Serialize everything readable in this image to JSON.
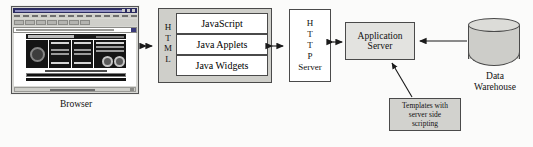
{
  "diagram": {
    "nodes": {
      "browser": {
        "caption": "Browser",
        "icon": "browser-window-icon"
      },
      "html": {
        "label": "HTML",
        "letters": [
          "H",
          "T",
          "M",
          "L"
        ],
        "children": [
          {
            "label": "JavaScript"
          },
          {
            "label": "Java Applets"
          },
          {
            "label": "Java Widgets"
          }
        ]
      },
      "http_server": {
        "label": "HTTP Server",
        "lines": [
          "H",
          "T",
          "T",
          "P",
          "Server"
        ]
      },
      "app_server": {
        "label": "Application Server",
        "line1": "Application",
        "line2": "Server"
      },
      "templates": {
        "label": "Templates with server side scripting",
        "line1": "Templates with",
        "line2": "server side",
        "line3": "scripting"
      },
      "data_warehouse": {
        "caption": "Data Warehouse",
        "line1": "Data",
        "line2": "Warehouse",
        "icon": "database-cylinder-icon"
      }
    },
    "connectors": [
      {
        "name": "browser-to-html",
        "type": "double-arrow"
      },
      {
        "name": "html-to-http-server",
        "type": "double-arrow"
      },
      {
        "name": "http-server-to-app-server",
        "type": "double-arrow"
      },
      {
        "name": "data-warehouse-to-app-server",
        "type": "single-arrow"
      },
      {
        "name": "templates-to-app-server",
        "type": "single-arrow"
      }
    ]
  },
  "colors": {
    "page_background": "#fbfbfa",
    "box_border": "#4a4a4a",
    "shaded_fill": "#cfcfca",
    "white_fill": "#ffffff",
    "text": "#111111"
  }
}
